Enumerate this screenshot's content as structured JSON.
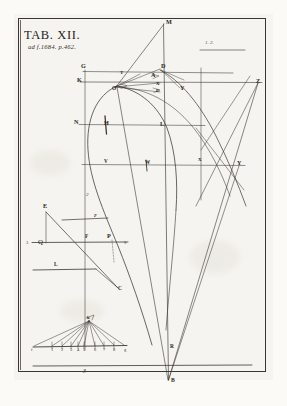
{
  "plate": {
    "title": "TAB. XII.",
    "subtitle": "ad f.1684. p.462.",
    "corner_note": "1. 2."
  },
  "main_figure": {
    "points": [
      {
        "id": "M",
        "label": "M",
        "x": 166,
        "y": 22
      },
      {
        "id": "D",
        "label": "D",
        "x": 163,
        "y": 66
      },
      {
        "id": "G",
        "label": "G",
        "x": 83,
        "y": 68
      },
      {
        "id": "K",
        "label": "K",
        "x": 79,
        "y": 80
      },
      {
        "id": "A",
        "label": "A",
        "x": 153,
        "y": 78
      },
      {
        "id": "T",
        "label": "T",
        "x": 122,
        "y": 76
      },
      {
        "id": "O",
        "label": "O",
        "x": 115,
        "y": 88
      },
      {
        "id": "X1",
        "label": "X",
        "x": 158,
        "y": 84
      },
      {
        "id": "E",
        "label": "E",
        "x": 158,
        "y": 92
      },
      {
        "id": "Y1",
        "label": "Y",
        "x": 182,
        "y": 88
      },
      {
        "id": "Z",
        "label": "Z",
        "x": 258,
        "y": 81
      },
      {
        "id": "N",
        "label": "N",
        "x": 76,
        "y": 122
      },
      {
        "id": "H",
        "label": "H",
        "x": 106,
        "y": 125
      },
      {
        "id": "L1",
        "label": "L",
        "x": 162,
        "y": 124
      },
      {
        "id": "V",
        "label": "V",
        "x": 106,
        "y": 163
      },
      {
        "id": "W",
        "label": "W",
        "x": 148,
        "y": 166
      },
      {
        "id": "X2",
        "label": "X",
        "x": 163,
        "y": 160
      },
      {
        "id": "Y2",
        "label": "Y",
        "x": 239,
        "y": 163
      },
      {
        "id": "R",
        "label": "R",
        "x": 168,
        "y": 348
      },
      {
        "id": "B",
        "label": "B",
        "x": 169,
        "y": 382
      }
    ]
  },
  "figure_2": {
    "number": "2",
    "points": [
      {
        "id": "E2",
        "label": "E",
        "x": 45,
        "y": 207
      },
      {
        "id": "F_top",
        "label": "F",
        "x": 96,
        "y": 222
      },
      {
        "id": "three",
        "label": "3",
        "x": 27,
        "y": 240
      },
      {
        "id": "Q",
        "label": "Q",
        "x": 40,
        "y": 241
      },
      {
        "id": "F",
        "label": "F",
        "x": 87,
        "y": 236
      },
      {
        "id": "P",
        "label": "P",
        "x": 109,
        "y": 236
      },
      {
        "id": "S",
        "label": "S",
        "x": 125,
        "y": 241
      },
      {
        "id": "L2",
        "label": "L",
        "x": 56,
        "y": 267
      },
      {
        "id": "C",
        "label": "C",
        "x": 117,
        "y": 289
      }
    ]
  },
  "figure_3": {
    "number": "3",
    "apex_label": "k",
    "left_label": "f",
    "right_label": "g",
    "axis_ticks": [
      "1",
      "2",
      "3",
      "4",
      "5",
      "6",
      "7",
      "8",
      "9"
    ]
  }
}
